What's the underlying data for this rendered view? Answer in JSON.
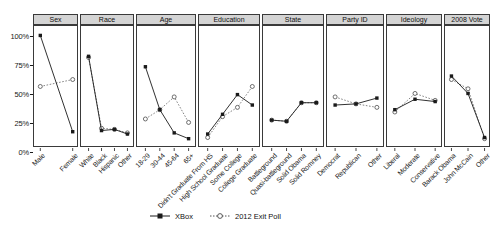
{
  "chart_data": {
    "type": "line",
    "title": "",
    "xlabel": "",
    "ylabel": "",
    "ylim": [
      0,
      100
    ],
    "ytick_labels": [
      "0%",
      "25%",
      "50%",
      "75%",
      "100%"
    ],
    "ytick_values": [
      0,
      25,
      50,
      75,
      100
    ],
    "grid": false,
    "legend_position": "bottom-center",
    "series_names": [
      "XBox",
      "2012 Exit Poll"
    ],
    "panels": [
      {
        "name": "Sex",
        "categories": [
          "Male",
          "Female"
        ],
        "series": [
          {
            "name": "XBox",
            "values": [
              91,
              8
            ]
          },
          {
            "name": "2012 Exit Poll",
            "values": [
              47,
              53
            ]
          }
        ]
      },
      {
        "name": "Race",
        "categories": [
          "White",
          "Black",
          "Hispanic",
          "Other"
        ],
        "series": [
          {
            "name": "XBox",
            "values": [
              73,
              9,
              10,
              6
            ]
          },
          {
            "name": "2012 Exit Poll",
            "values": [
              72,
              11,
              10,
              7
            ]
          }
        ]
      },
      {
        "name": "Age",
        "categories": [
          "18-29",
          "30-44",
          "45-64",
          "65+"
        ],
        "series": [
          {
            "name": "XBox",
            "values": [
              64,
              27,
              7,
              2
            ]
          },
          {
            "name": "2012 Exit Poll",
            "values": [
              19,
              27,
              38,
              16
            ]
          }
        ]
      },
      {
        "name": "Education",
        "categories": [
          "Didn't Graduate From HS",
          "High School Graduate",
          "Some College",
          "College Graduate"
        ],
        "series": [
          {
            "name": "XBox",
            "values": [
              6,
              23,
              40,
              31
            ]
          },
          {
            "name": "2012 Exit Poll",
            "values": [
              3,
              21,
              29,
              47
            ]
          }
        ]
      },
      {
        "name": "State",
        "categories": [
          "Battleground",
          "Quasi-battleground",
          "Solid Obama",
          "Solid Romney"
        ],
        "series": [
          {
            "name": "XBox",
            "values": [
              18,
              17,
              33,
              33
            ]
          },
          {
            "name": "2012 Exit Poll",
            "values": [
              18,
              17,
              33,
              33
            ]
          }
        ]
      },
      {
        "name": "Party ID",
        "categories": [
          "Democrat",
          "Republican",
          "Other"
        ],
        "series": [
          {
            "name": "XBox",
            "values": [
              31,
              32,
              37
            ]
          },
          {
            "name": "2012 Exit Poll",
            "values": [
              38,
              32,
              29
            ]
          }
        ]
      },
      {
        "name": "Ideology",
        "categories": [
          "Liberal",
          "Moderate",
          "Conservative"
        ],
        "series": [
          {
            "name": "XBox",
            "values": [
              27,
              36,
              34
            ]
          },
          {
            "name": "2012 Exit Poll",
            "values": [
              25,
              41,
              35
            ]
          }
        ]
      },
      {
        "name": "2008 Vote",
        "categories": [
          "Barack Obama",
          "John McCain",
          "Other"
        ],
        "series": [
          {
            "name": "XBox",
            "values": [
              56,
              41,
              3
            ]
          },
          {
            "name": "2012 Exit Poll",
            "values": [
              53,
              45,
              2
            ]
          }
        ]
      }
    ]
  },
  "legend": {
    "items": [
      {
        "label": "XBox",
        "style": "solid-filled-square"
      },
      {
        "label": "2012 Exit Poll",
        "style": "dotted-open-circle"
      }
    ]
  },
  "colors": {
    "line": "#1a1a1a",
    "strip_bg": "#d4d4d4",
    "panel_border": "#3a3a3a",
    "background": "#ffffff"
  }
}
